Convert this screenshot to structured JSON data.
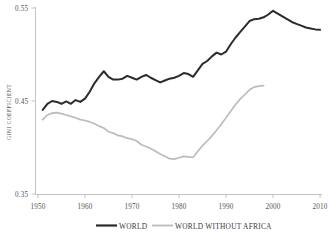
{
  "chart_data": {
    "type": "line",
    "title": "",
    "subtitle": "",
    "xlabel": "",
    "ylabel": "GINI COEFFICIENT",
    "xlim": [
      1950,
      2010
    ],
    "ylim": [
      0.35,
      0.55
    ],
    "grid": false,
    "legend_position": "bottom-center",
    "xticks": [
      1950,
      1960,
      1970,
      1980,
      1990,
      2000,
      2010
    ],
    "xtick_labels": [
      "1950",
      "1960",
      "1970",
      "1980",
      "1990",
      "2000",
      "2010"
    ],
    "yticks": [
      0.35,
      0.45,
      0.55
    ],
    "ytick_labels": [
      "0.35",
      "0.45",
      "0.55"
    ],
    "series": [
      {
        "name": "WORLD",
        "color": "#2b2b2b",
        "x": [
          1951,
          1952,
          1953,
          1954,
          1955,
          1956,
          1957,
          1958,
          1959,
          1960,
          1961,
          1962,
          1963,
          1964,
          1965,
          1966,
          1967,
          1968,
          1969,
          1970,
          1971,
          1972,
          1973,
          1974,
          1975,
          1976,
          1977,
          1978,
          1979,
          1980,
          1981,
          1982,
          1983,
          1984,
          1985,
          1986,
          1987,
          1988,
          1989,
          1990,
          1991,
          1992,
          1993,
          1994,
          1995,
          1996,
          1997,
          1998,
          1999,
          2000,
          2001,
          2002,
          2003,
          2004,
          2005,
          2006,
          2007,
          2008,
          2009,
          2010
        ],
        "values": [
          0.4405,
          0.447,
          0.45,
          0.449,
          0.447,
          0.4495,
          0.447,
          0.451,
          0.449,
          0.4525,
          0.46,
          0.469,
          0.476,
          0.482,
          0.476,
          0.473,
          0.473,
          0.474,
          0.477,
          0.475,
          0.473,
          0.476,
          0.478,
          0.475,
          0.4725,
          0.47,
          0.472,
          0.474,
          0.475,
          0.477,
          0.48,
          0.479,
          0.476,
          0.483,
          0.49,
          0.493,
          0.498,
          0.502,
          0.5,
          0.503,
          0.511,
          0.518,
          0.524,
          0.53,
          0.536,
          0.538,
          0.5385,
          0.54,
          0.543,
          0.547,
          0.544,
          0.541,
          0.538,
          0.535,
          0.533,
          0.531,
          0.529,
          0.528,
          0.527,
          0.5265
        ]
      },
      {
        "name": "WORLD WITHOUT AFRICA",
        "color": "#bcbcbc",
        "x": [
          1951,
          1952,
          1953,
          1954,
          1955,
          1956,
          1957,
          1958,
          1959,
          1960,
          1961,
          1962,
          1963,
          1964,
          1965,
          1966,
          1967,
          1968,
          1969,
          1970,
          1971,
          1972,
          1973,
          1974,
          1975,
          1976,
          1977,
          1978,
          1979,
          1980,
          1981,
          1982,
          1983,
          1984,
          1985,
          1986,
          1987,
          1988,
          1989,
          1990,
          1991,
          1992,
          1993,
          1994,
          1995,
          1996,
          1997,
          1998
        ],
        "values": [
          0.43,
          0.435,
          0.437,
          0.4375,
          0.4365,
          0.435,
          0.4335,
          0.432,
          0.43,
          0.429,
          0.4275,
          0.4255,
          0.423,
          0.421,
          0.417,
          0.4155,
          0.413,
          0.412,
          0.41,
          0.409,
          0.407,
          0.403,
          0.401,
          0.399,
          0.396,
          0.393,
          0.3905,
          0.388,
          0.3875,
          0.389,
          0.3905,
          0.39,
          0.3895,
          0.396,
          0.402,
          0.407,
          0.4125,
          0.4185,
          0.425,
          0.432,
          0.439,
          0.446,
          0.452,
          0.457,
          0.462,
          0.465,
          0.466,
          0.4665
        ]
      }
    ],
    "annotations": []
  },
  "legend": {
    "items": [
      {
        "label": "WORLD",
        "color": "#2b2b2b"
      },
      {
        "label": "WORLD WITHOUT AFRICA",
        "color": "#bcbcbc"
      }
    ]
  },
  "axis": {
    "y_title": "GINI COEFFICIENT",
    "y_labels": [
      "0.55",
      "0.45",
      "0.35"
    ],
    "x_labels": [
      "1950",
      "1960",
      "1970",
      "1980",
      "1990",
      "2000",
      "2010"
    ]
  },
  "colors": {
    "axis": "#b5b5b5",
    "text": "#555555",
    "world": "#2b2b2b",
    "world_without_africa": "#bcbcbc",
    "background": "#ffffff"
  }
}
